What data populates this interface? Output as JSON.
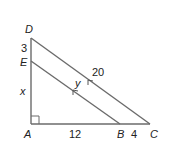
{
  "diagram": {
    "type": "right-triangle-parallel-lines",
    "colors": {
      "line": "#6b6b6b",
      "text": "#222222",
      "background": "#ffffff"
    },
    "points": {
      "D": {
        "label": "D",
        "x": 31,
        "y": 38
      },
      "E": {
        "label": "E",
        "x": 31,
        "y": 61
      },
      "A": {
        "label": "A",
        "x": 31,
        "y": 124
      },
      "B": {
        "label": "B",
        "x": 120,
        "y": 124
      },
      "C": {
        "label": "C",
        "x": 150,
        "y": 124
      }
    },
    "segments": [
      {
        "from": "D",
        "to": "A"
      },
      {
        "from": "A",
        "to": "C"
      },
      {
        "from": "D",
        "to": "C",
        "parallel_marker": true
      },
      {
        "from": "E",
        "to": "B",
        "parallel_marker": true
      }
    ],
    "right_angle_at": "A",
    "measures": {
      "DE": "3",
      "EA": "x",
      "AB": "12",
      "BC": "4",
      "DC": "20",
      "EB": "y"
    }
  }
}
